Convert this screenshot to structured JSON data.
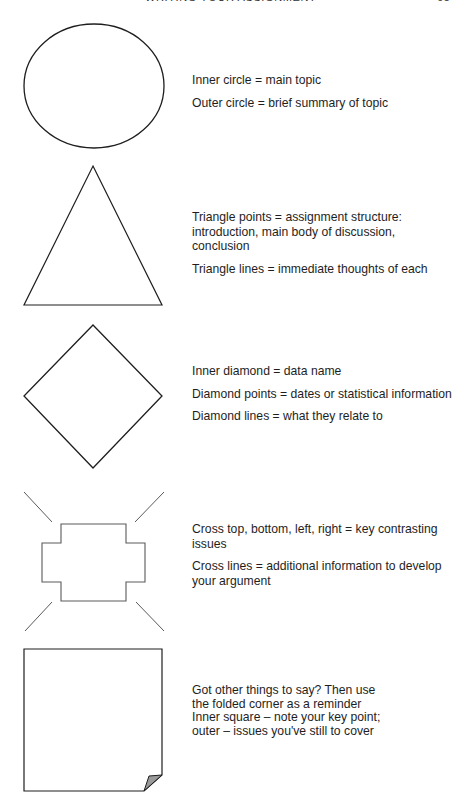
{
  "running_head": {
    "title": "WRITING YOUR ASSIGNMENT",
    "page_number": "65"
  },
  "sections": [
    {
      "shape": "circle",
      "lines": [
        "Inner circle = main topic",
        "Outer circle = brief summary of topic"
      ]
    },
    {
      "shape": "triangle",
      "lines": [
        "Triangle points = assignment structure: introduction, main body of discussion, conclusion",
        "Triangle lines = immediate thoughts of each"
      ]
    },
    {
      "shape": "diamond",
      "lines": [
        "Inner diamond = data name",
        "Diamond points = dates or statistical information",
        "Diamond lines = what they relate to"
      ]
    },
    {
      "shape": "cross",
      "lines": [
        "Cross top, bottom, left, right = key contrasting issues",
        "Cross lines = additional information to develop your argument"
      ]
    },
    {
      "shape": "folded-square",
      "lines": [
        "Got other things to say? Then use the folded corner as a reminder",
        "Inner square – note your key point; outer – issues you've still to cover"
      ]
    }
  ],
  "colors": {
    "stroke": "#1e1e1e",
    "cross_stroke": "#5a5a5a",
    "fold_fill": "#9a9a9a"
  }
}
